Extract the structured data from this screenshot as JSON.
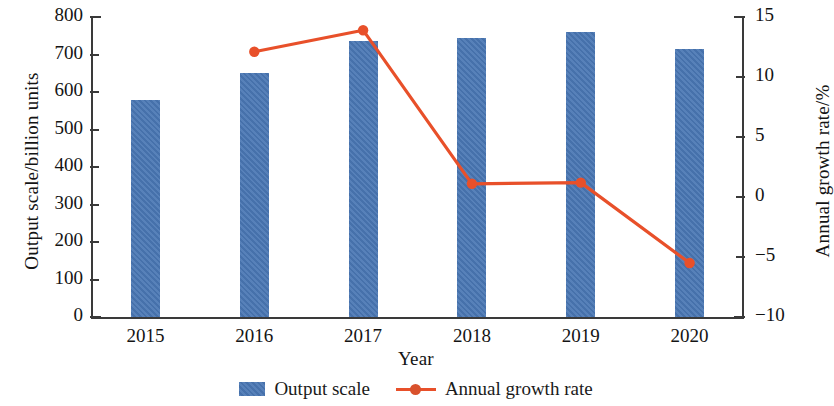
{
  "chart_data": {
    "type": "bar",
    "title": "",
    "subtitle": "",
    "xlabel": "Year",
    "categories": [
      "2015",
      "2016",
      "2017",
      "2018",
      "2019",
      "2020"
    ],
    "grid": false,
    "legend_position": "bottom",
    "series": [
      {
        "name": "Output scale",
        "type": "bar",
        "axis": "left",
        "color": "#4a77b4",
        "unit": "billion units",
        "values": [
          580,
          650,
          735,
          745,
          760,
          715
        ]
      },
      {
        "name": "Annual growth rate",
        "type": "line",
        "axis": "right",
        "color": "#e8502a",
        "unit": "%",
        "values": [
          null,
          12.1,
          13.9,
          1.1,
          1.2,
          -5.5
        ]
      }
    ],
    "axes": {
      "left": {
        "label": "Output scale/billion units",
        "ticks": [
          0,
          100,
          200,
          300,
          400,
          500,
          600,
          700,
          800
        ],
        "tick_labels": [
          "0",
          "100",
          "200",
          "300",
          "400",
          "500",
          "600",
          "700",
          "800"
        ],
        "min": 0,
        "max": 800
      },
      "right": {
        "label": "Annual growth rate/%",
        "ticks": [
          -10,
          -5,
          0,
          5,
          10,
          15
        ],
        "tick_labels": [
          "−10",
          "−5",
          "0",
          "5",
          "10",
          "15"
        ],
        "min": -10,
        "max": 15
      },
      "x": {
        "label": "Year",
        "tick_labels": [
          "2015",
          "2016",
          "2017",
          "2018",
          "2019",
          "2020"
        ]
      }
    },
    "legend": [
      {
        "label": "Output scale",
        "marker": "square-swatch",
        "color": "#4a77b4"
      },
      {
        "label": "Annual growth rate",
        "marker": "line-with-dot",
        "color": "#e8502a"
      }
    ]
  }
}
